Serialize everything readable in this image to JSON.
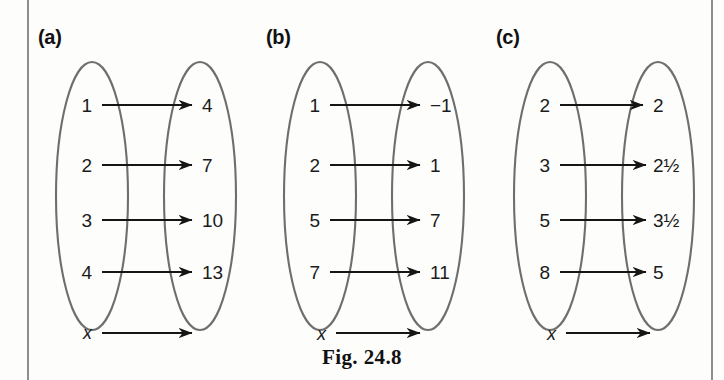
{
  "figure": {
    "caption": "Fig. 24.8",
    "variable_symbol": "x"
  },
  "colors": {
    "ink": "#1b1b1b",
    "ellipse_stroke": "#6e6e6e",
    "arrow": "#151515",
    "page_rule": "#8e8e8e",
    "background": "#fdfdfc"
  },
  "panels": [
    {
      "label": "(a)",
      "name": "panel-a",
      "rows": [
        {
          "domain": "1",
          "range": "4"
        },
        {
          "domain": "2",
          "range": "7"
        },
        {
          "domain": "3",
          "range": "10"
        },
        {
          "domain": "4",
          "range": "13"
        }
      ],
      "variable_row": {
        "domain": "x",
        "range": ""
      }
    },
    {
      "label": "(b)",
      "name": "panel-b",
      "rows": [
        {
          "domain": "1",
          "range": "−1"
        },
        {
          "domain": "2",
          "range": "1"
        },
        {
          "domain": "5",
          "range": "7"
        },
        {
          "domain": "7",
          "range": "11"
        }
      ],
      "variable_row": {
        "domain": "x",
        "range": ""
      }
    },
    {
      "label": "(c)",
      "name": "panel-c",
      "rows": [
        {
          "domain": "2",
          "range": "2"
        },
        {
          "domain": "3",
          "range": "2½"
        },
        {
          "domain": "5",
          "range": "3½"
        },
        {
          "domain": "8",
          "range": "5"
        }
      ],
      "variable_row": {
        "domain": "x",
        "range": ""
      }
    }
  ],
  "geometry": {
    "row_y": [
      105,
      165,
      220,
      272
    ],
    "variable_row_y": 333,
    "left_ellipse": {
      "cx": 62,
      "cy": 196,
      "rx": 36,
      "ry": 134
    },
    "right_ellipse": {
      "cx": 170,
      "cy": 196,
      "rx": 36,
      "ry": 134
    },
    "arrow_start_x": 72,
    "arrow_end_x": 162
  }
}
